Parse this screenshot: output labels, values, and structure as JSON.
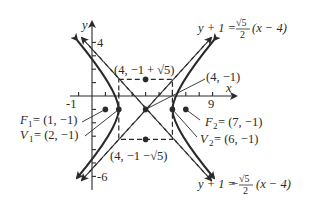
{
  "figure": {
    "type": "hyperbola-graph",
    "axes": {
      "x_label": "x",
      "y_label": "y",
      "x_ticks_labeled": [
        "-1",
        "9"
      ],
      "y_ticks_labeled": [
        "4",
        "-6"
      ]
    },
    "center": {
      "label": "(4, −1)",
      "x": 4,
      "y": -1
    },
    "conjugate_top": {
      "label": "(4, −1 + √5)"
    },
    "conjugate_bottom": {
      "label": "(4, −1 −√5)"
    },
    "foci": [
      {
        "name": "F",
        "sub": "1",
        "value": " = (1, −1)"
      },
      {
        "name": "F",
        "sub": "2",
        "value": " = (7, −1)"
      }
    ],
    "vertices": [
      {
        "name": "V",
        "sub": "1",
        "value": " = (2, −1)"
      },
      {
        "name": "V",
        "sub": "2",
        "value": " = (6, −1)"
      }
    ],
    "asymptotes": [
      {
        "lhs": "y + 1 = ",
        "sign": "",
        "num": "√5",
        "den": "2",
        "rhs": "(x − 4)"
      },
      {
        "lhs": "y + 1 = ",
        "sign": "−",
        "num": "√5",
        "den": "2",
        "rhs": "(x −  4)"
      }
    ],
    "colors": {
      "ink": "#2a2a2a",
      "background": "#ffffff"
    }
  }
}
